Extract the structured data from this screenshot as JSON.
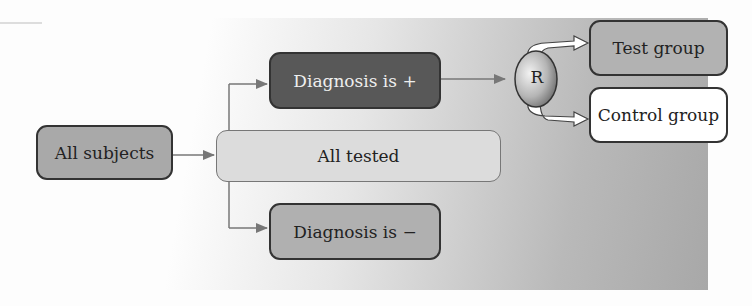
{
  "diagram": {
    "type": "flowchart",
    "nodes": {
      "all_subjects": "All subjects",
      "all_tested": "All tested",
      "diagnosis_positive": "Diagnosis is +",
      "diagnosis_negative": "Diagnosis is −",
      "randomization": "R",
      "test_group": "Test group",
      "control_group": "Control group"
    },
    "edges": [
      {
        "from": "All subjects",
        "to": "All tested"
      },
      {
        "from": "All tested",
        "to": "Diagnosis is +"
      },
      {
        "from": "All tested",
        "to": "Diagnosis is −"
      },
      {
        "from": "Diagnosis is +",
        "to": "R"
      },
      {
        "from": "R",
        "to": "Test group"
      },
      {
        "from": "R",
        "to": "Control group"
      }
    ],
    "colors": {
      "all_subjects": "#a9a9a9",
      "all_tested": "#dcdcdc",
      "diagnosis_positive": "#585858",
      "diagnosis_negative": "#b0b0b0",
      "test_group": "#b2b2b2",
      "control_group": "#ffffff",
      "connector": "#777777"
    }
  }
}
